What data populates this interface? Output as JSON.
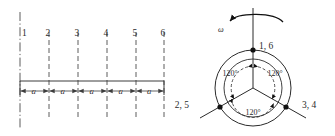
{
  "figure": {
    "name": "slot-layout-and-phasor-star-diagram",
    "left_diagram": {
      "name": "coil-side-linear-layout",
      "slot_labels": [
        "1",
        "2",
        "3",
        "4",
        "5",
        "6"
      ],
      "pitch_labels": [
        "a",
        "a",
        "a",
        "a",
        "a"
      ],
      "pitch_count": 5,
      "line_color": "#3d3d3d",
      "dash_color": "#4a4a4a"
    },
    "right_diagram": {
      "name": "phase-star-diagram",
      "rotation_label": "ω",
      "node_labels": [
        "1, 6",
        "2, 5",
        "3, 4"
      ],
      "angle_labels": [
        "120°",
        "120°",
        "120°"
      ],
      "circle_color": "#2b2b2b",
      "node_color": "#111111"
    }
  }
}
